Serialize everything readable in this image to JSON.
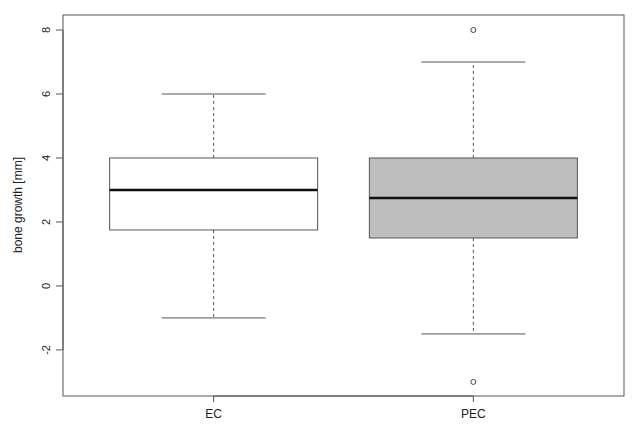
{
  "chart_data": {
    "type": "boxplot",
    "title": "",
    "xlabel": "",
    "ylabel": "bone growth [mm]",
    "categories": [
      "EC",
      "PEC"
    ],
    "ylim": [
      -3.44,
      8.47
    ],
    "yticks": [
      -2,
      0,
      2,
      4,
      6,
      8
    ],
    "ytick_labels": [
      "-2",
      "0",
      "2",
      "4",
      "6",
      "8"
    ],
    "grid": false,
    "legend": "none",
    "series": [
      {
        "name": "EC",
        "whisker_low": -1,
        "q1": 1.75,
        "median": 3,
        "q3": 4,
        "whisker_high": 6,
        "outliers": [],
        "fill": "#ffffff"
      },
      {
        "name": "PEC",
        "whisker_low": -1.5,
        "q1": 1.5,
        "median": 2.75,
        "q3": 4,
        "whisker_high": 7,
        "outliers": [
          8,
          -3
        ],
        "fill": "#bebebe"
      }
    ]
  }
}
